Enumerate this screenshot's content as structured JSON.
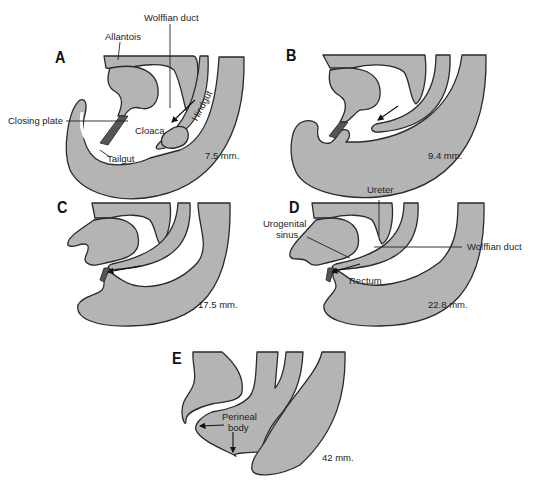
{
  "figure": {
    "fill_color": "#b4b4b4",
    "outline_color": "#2a2a2a",
    "panels": [
      {
        "letter": "A",
        "size": "7.5 mm.",
        "labels": {
          "allantois": "Allantois",
          "wolffian_duct": "Wolffian duct",
          "hindgut": "Hindgut",
          "closing_plate": "Closing plate",
          "cloaca": "Cloaca",
          "tailgut": "Tailgut"
        }
      },
      {
        "letter": "B",
        "size": "9.4 mm.",
        "labels": {}
      },
      {
        "letter": "C",
        "size": "17.5 mm.",
        "labels": {}
      },
      {
        "letter": "D",
        "size": "22.8 mm.",
        "labels": {
          "ureter": "Ureter",
          "urogenital_sinus_line1": "Urogenital",
          "urogenital_sinus_line2": "sinus",
          "wolffian_duct": "Wolffian duct",
          "rectum": "Rectum"
        }
      },
      {
        "letter": "E",
        "size": "42 mm.",
        "labels": {
          "perineal_body_line1": "Perineal",
          "perineal_body_line2": "body"
        }
      }
    ]
  }
}
